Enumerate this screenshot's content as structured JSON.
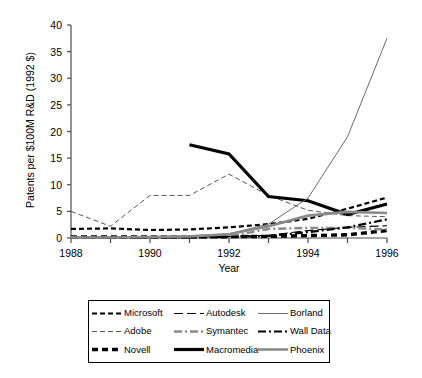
{
  "chart_data": {
    "type": "line",
    "title": "",
    "xlabel": "Year",
    "ylabel": "Patents per $100M R&D (1992 $)",
    "xlim": [
      1988,
      1996
    ],
    "ylim": [
      0,
      40
    ],
    "ytick_values": [
      0,
      5,
      10,
      15,
      20,
      25,
      30,
      35,
      40
    ],
    "ytick_labels": [
      "0",
      "5",
      "10",
      "15",
      "20",
      "25",
      "30",
      "35",
      "40"
    ],
    "xtick_values": [
      1988,
      1989,
      1990,
      1991,
      1992,
      1993,
      1994,
      1995,
      1996
    ],
    "xtick_labels": [
      "1988",
      "",
      "1990",
      "",
      "1992",
      "",
      "1994",
      "",
      "1996"
    ],
    "grid": false,
    "legend_position": "below-center",
    "series": [
      {
        "name": "Microsoft",
        "style": "medium-dash",
        "color": "#000000",
        "width": 2.2,
        "dash": "5,3",
        "x": [
          1988,
          1989,
          1990,
          1991,
          1992,
          1993,
          1994,
          1995,
          1996
        ],
        "values": [
          1.7,
          1.8,
          1.5,
          1.6,
          2.0,
          2.6,
          3.6,
          5.5,
          7.6
        ]
      },
      {
        "name": "Adobe",
        "style": "thin-dash",
        "color": "#555555",
        "width": 1.0,
        "dash": "5,3",
        "x": [
          1988,
          1989,
          1990,
          1991,
          1992,
          1993,
          1994,
          1995,
          1996
        ],
        "values": [
          5.0,
          2.2,
          8.0,
          8.0,
          12.0,
          8.0,
          5.2,
          4.2,
          4.0
        ]
      },
      {
        "name": "Novell",
        "style": "thick-dash",
        "color": "#000000",
        "width": 3.4,
        "dash": "6,4",
        "x": [
          1988,
          1989,
          1990,
          1991,
          1992,
          1993,
          1994,
          1995,
          1996
        ],
        "values": [
          0.2,
          0.2,
          0.2,
          0.2,
          0.25,
          0.3,
          0.45,
          0.6,
          1.4
        ]
      },
      {
        "name": "Autodesk",
        "style": "long-dash",
        "color": "#000000",
        "width": 1.2,
        "dash": "9,4",
        "x": [
          1988,
          1989,
          1990,
          1991,
          1992,
          1993,
          1994,
          1995,
          1996
        ],
        "values": [
          0.1,
          0.1,
          0.15,
          0.2,
          0.3,
          0.5,
          1.4,
          2.0,
          2.3
        ]
      },
      {
        "name": "Symantec",
        "style": "gray-dash-dot",
        "color": "#8a8a8a",
        "width": 2.4,
        "dash": "8,3,2,3",
        "x": [
          1988,
          1989,
          1990,
          1991,
          1992,
          1993,
          1994,
          1995,
          1996
        ],
        "values": [
          0.1,
          0.1,
          0.1,
          0.15,
          0.3,
          1.7,
          1.9,
          1.9,
          1.6
        ]
      },
      {
        "name": "Macromedia",
        "style": "thick-solid",
        "color": "#000000",
        "width": 3.2,
        "dash": "none",
        "x": [
          1991,
          1992,
          1993,
          1994,
          1995,
          1996
        ],
        "values": [
          17.5,
          15.8,
          7.8,
          7.0,
          4.4,
          6.4
        ]
      },
      {
        "name": "Borland",
        "style": "thin-solid",
        "color": "#6b6b6b",
        "width": 1.0,
        "dash": "none",
        "x": [
          1988,
          1989,
          1990,
          1991,
          1992,
          1993,
          1994,
          1995,
          1996
        ],
        "values": [
          0.1,
          0.1,
          0.2,
          0.4,
          0.8,
          2.6,
          7.5,
          19.0,
          37.5
        ]
      },
      {
        "name": "Wall Data",
        "style": "dash-dot",
        "color": "#000000",
        "width": 2.2,
        "dash": "8,3,2,3",
        "x": [
          1988,
          1989,
          1990,
          1991,
          1992,
          1993,
          1994,
          1995,
          1996
        ],
        "values": [
          0.05,
          0.05,
          0.1,
          0.1,
          0.2,
          0.4,
          1.1,
          2.0,
          3.5
        ]
      },
      {
        "name": "Phoenix",
        "style": "gray-solid",
        "color": "#8a8a8a",
        "width": 2.6,
        "dash": "none",
        "x": [
          1988,
          1989,
          1990,
          1991,
          1992,
          1993,
          1994,
          1995,
          1996
        ],
        "values": [
          0.1,
          0.1,
          0.2,
          0.3,
          0.7,
          2.2,
          4.2,
          4.9,
          4.7
        ]
      }
    ]
  },
  "legend": {
    "rows": [
      [
        {
          "label": "Microsoft",
          "series": "Microsoft"
        },
        {
          "label": "Autodesk",
          "series": "Autodesk"
        },
        {
          "label": "Borland",
          "series": "Borland"
        }
      ],
      [
        {
          "label": "Adobe",
          "series": "Adobe"
        },
        {
          "label": "Symantec",
          "series": "Symantec"
        },
        {
          "label": "Wall Data",
          "series": "Wall Data"
        }
      ],
      [
        {
          "label": "Novell",
          "series": "Novell"
        },
        {
          "label": "Macromedia",
          "series": "Macromedia"
        },
        {
          "label": "Phoenix",
          "series": "Phoenix"
        }
      ]
    ]
  }
}
